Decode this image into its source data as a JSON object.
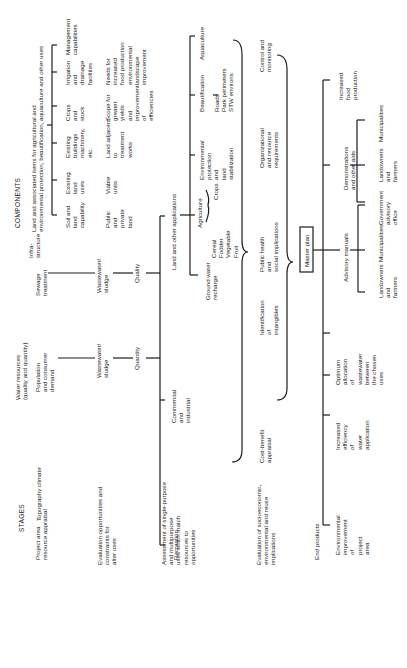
{
  "headers": {
    "stages": "STAGES",
    "components": "COMPONENTS"
  },
  "stages": {
    "s1": "Project area\nresource appraisal",
    "s2": "Evaluation opportunities and\nconstraints for\nalter uses",
    "s3": "Assessment of single-purpose\nand multipurpose\nuses which match\nresources to\nopportunities",
    "s4": "Evaluation of socioeconomic,\nenvironmental and reuse\nimplications",
    "s5": "End products"
  },
  "row1": {
    "topography": "Topography climate",
    "water_resources": "Water resources\n(quality and quantity)",
    "population": "Population\nand consumer\ndemand",
    "sewage": "Sewage\ntreatment",
    "infrastructure": "Infra-\nstructure",
    "land_items": "Land and associated items for agricultural and\nenvironmental protection, beautification, aquaculture and other uses"
  },
  "land_items_children": [
    "Soil and\nland\ncapability",
    "Existing\nland\nuses",
    "Existing\nbuildings\nmachinery,\netc.",
    "Crops\nand\nstock",
    "Irrigation\nand\ndrainage\nfacilities",
    "Management\ncapabilities"
  ],
  "land_items_sub": [
    "Public\nand\nprivate\nland",
    "Viable\nunits",
    "Land adjacent\nto\ntreatment\nworks",
    "Scope for\ngreater\nyields\nand\nimprovement\nof\nefficiencies",
    "Needs for\nincreased\nfood production\nenvironmental\nlandscape\nimprovement"
  ],
  "row2": {
    "wastewater_left": "Wastewater/\nsludge",
    "wastewater_right": "Wastewater/\nsludge",
    "quantity": "Quantity",
    "quality": "Quality"
  },
  "row3": {
    "recreation": "Recreation",
    "commercial": "Commercial\nand\nindustrial",
    "land_other": "Land and other applications",
    "groundwater": "Ground water\nrecharge",
    "agriculture": "Agriculture",
    "crops_list": "Cereal\nFodder\nVegetable\nFruit",
    "crops": "Crops",
    "env_protection": "Environmental\nprotection\nand\nland\nstabilization",
    "beautification": "Beautification",
    "beaut_list": "Roads\nPark perimeters\nSTW environs",
    "aquaculture": "Aquaculture"
  },
  "row4": {
    "cost_benefit": "Cost-benefit\nappraisal",
    "intangibles": "Identification\nof\nintangibles",
    "public_health": "Public health\nand\nsocial implications",
    "organizational": "Organizational\nand resource\nrequirements",
    "control": "Control and\nmonitoring"
  },
  "master_plan": "Master plan",
  "end_products": {
    "env_improvement": "Environmental\nimprovement\nof\nproject\narea",
    "efficiency": "Increased\nefficiency\nof\nwater\napplication",
    "allocation": "Optimum\nallocation\nof\nwastewater\nbetween\nthe chosen\nuses",
    "advisory": "Advisory manuals",
    "adv_children": [
      "Landowners\nand\nfarmers",
      "Municipalities",
      "Government\nadvisory\noffice"
    ],
    "demonstrations": "Demonstrations\nand other aids",
    "demo_children": [
      "Landowners\nand\nfarmers",
      "Municipalities"
    ],
    "food": "Increased\nfood\nproduction"
  }
}
